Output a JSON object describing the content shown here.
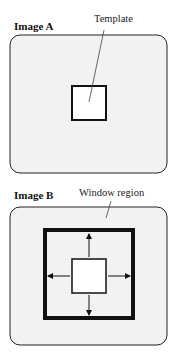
{
  "panels": [
    {
      "title": "Image A",
      "callout": "Template"
    },
    {
      "title": "Image B",
      "callout": "Window region"
    }
  ],
  "colors": {
    "frame_fill": "#f2f2f2",
    "stroke": "#111111",
    "template_fill": "#ffffff"
  }
}
